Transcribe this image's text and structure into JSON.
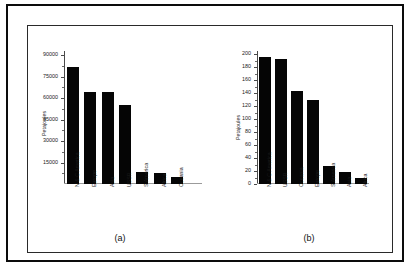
{
  "figure": {
    "background_color": "#ffffff",
    "frame_color": "#0c0c0c",
    "bar_color": "#050505",
    "axis_color": "#4a4a4a"
  },
  "panels": [
    {
      "id": "a",
      "caption": "(a)",
      "ylabel": "Petajoules"
    },
    {
      "id": "b",
      "caption": "(b)",
      "ylabel": "Petajoules"
    }
  ],
  "chart_data": [
    {
      "type": "bar",
      "title": "",
      "panel": "(a)",
      "xlabel": "",
      "ylabel": "Petajoules",
      "ylim": [
        0,
        93000
      ],
      "yticks": [
        15000,
        30000,
        45000,
        60000,
        75000,
        90000
      ],
      "ytick_labels": [
        "15000",
        "30000",
        "45000",
        "60000",
        "75000",
        "90000"
      ],
      "grid": false,
      "legend": "none",
      "categories": [
        "N & C America",
        "Europe",
        "Asia",
        "USSR",
        "S America",
        "Africa",
        "Oceania"
      ],
      "values": [
        81500,
        64500,
        64000,
        55500,
        8500,
        7500,
        5000
      ]
    },
    {
      "type": "bar",
      "title": "",
      "panel": "(b)",
      "xlabel": "",
      "ylabel": "Petajoules",
      "ylim": [
        0,
        205
      ],
      "yticks": [
        0,
        20,
        40,
        60,
        80,
        100,
        120,
        140,
        160,
        180,
        200
      ],
      "ytick_labels": [
        "0",
        "20",
        "40",
        "60",
        "80",
        "100",
        "120",
        "140",
        "160",
        "180",
        "200"
      ],
      "grid": false,
      "legend": "none",
      "categories": [
        "N & C America",
        "USSR",
        "Oceania",
        "Europe",
        "S America",
        "Asia",
        "Africa"
      ],
      "values": [
        196,
        192,
        144,
        129,
        27,
        19,
        10
      ]
    }
  ]
}
